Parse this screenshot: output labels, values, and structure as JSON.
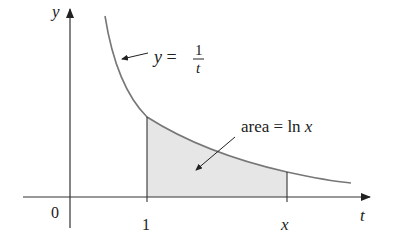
{
  "figure": {
    "y_axis_label": "y",
    "t_axis_label": "t",
    "origin_label": "0",
    "tick_one_label": "1",
    "tick_x_label": "x",
    "curve_label_lhs": "y =",
    "curve_label_num": "1",
    "curve_label_den": "t",
    "area_label_prefix": "area = ln ",
    "area_label_var": "x",
    "colors": {
      "axis": "#333333",
      "curve": "#777777",
      "shade": "#e6e6e6"
    }
  }
}
